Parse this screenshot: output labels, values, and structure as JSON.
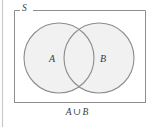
{
  "figure": {
    "type": "venn-diagram",
    "title": "",
    "universal_set_label": "S",
    "caption": {
      "left_operand": "A",
      "operator": "∪",
      "right_operand": "B",
      "full_text": "A ∪ B"
    },
    "sets": [
      {
        "id": "A",
        "label": "A",
        "cx": 59,
        "cy": 58,
        "r": 35
      },
      {
        "id": "B",
        "label": "B",
        "cx": 99,
        "cy": 58,
        "r": 35
      }
    ],
    "universe_rect": {
      "x": 14,
      "y": 10,
      "width": 132,
      "height": 93
    },
    "page_rule": {
      "x": 2,
      "y": 0,
      "height": 127
    },
    "colors": {
      "background": "#ffffff",
      "set_fill": "#f1f1f1",
      "set_stroke": "#8d8d8d",
      "rect_stroke": "#8d8d8d",
      "text": "#3a3a3a",
      "page_rule": "#c9c9c9"
    },
    "shaded_region": "A ∪ B"
  }
}
